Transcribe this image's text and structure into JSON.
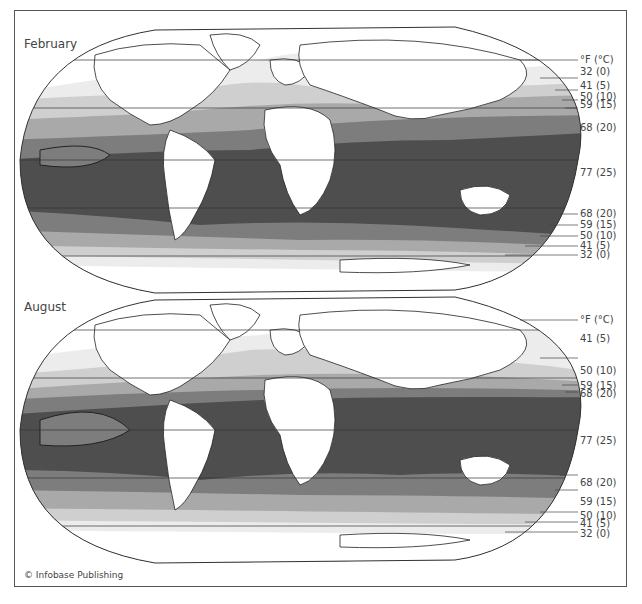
{
  "maps": [
    {
      "title": "February",
      "unit_header": "°F (°C)",
      "legend": [
        {
          "label": "32 (0)",
          "y": 72
        },
        {
          "label": "41 (5)",
          "y": 86
        },
        {
          "label": "50 (10)",
          "y": 97
        },
        {
          "label": "59 (15)",
          "y": 105
        },
        {
          "label": "68 (20)",
          "y": 128
        },
        {
          "label": "77 (25)",
          "y": 173
        },
        {
          "label": "68 (20)",
          "y": 214
        },
        {
          "label": "59 (15)",
          "y": 225
        },
        {
          "label": "50 (10)",
          "y": 236
        },
        {
          "label": "41 (5)",
          "y": 246
        },
        {
          "label": "32 (0)",
          "y": 255
        }
      ]
    },
    {
      "title": "August",
      "unit_header": "°F (°C)",
      "legend": [
        {
          "label": "41 (5)",
          "y": 339
        },
        {
          "label": "50 (10)",
          "y": 371
        },
        {
          "label": "59 (15)",
          "y": 386
        },
        {
          "label": "68 (20)",
          "y": 394
        },
        {
          "label": "77 (25)",
          "y": 441
        },
        {
          "label": "68 (20)",
          "y": 483
        },
        {
          "label": "59 (15)",
          "y": 502
        },
        {
          "label": "50 (10)",
          "y": 516
        },
        {
          "label": "41 (5)",
          "y": 524
        },
        {
          "label": "32 (0)",
          "y": 534
        }
      ]
    }
  ],
  "colors": {
    "c32": "#ffffff",
    "c41": "#ececec",
    "c50": "#cfcfcf",
    "c59": "#a9a9a9",
    "c68": "#7d7d7d",
    "c77": "#4e4e4e",
    "land": "#ffffff",
    "inland_sea": "#6a6a6a"
  },
  "credit": "© Infobase Publishing"
}
